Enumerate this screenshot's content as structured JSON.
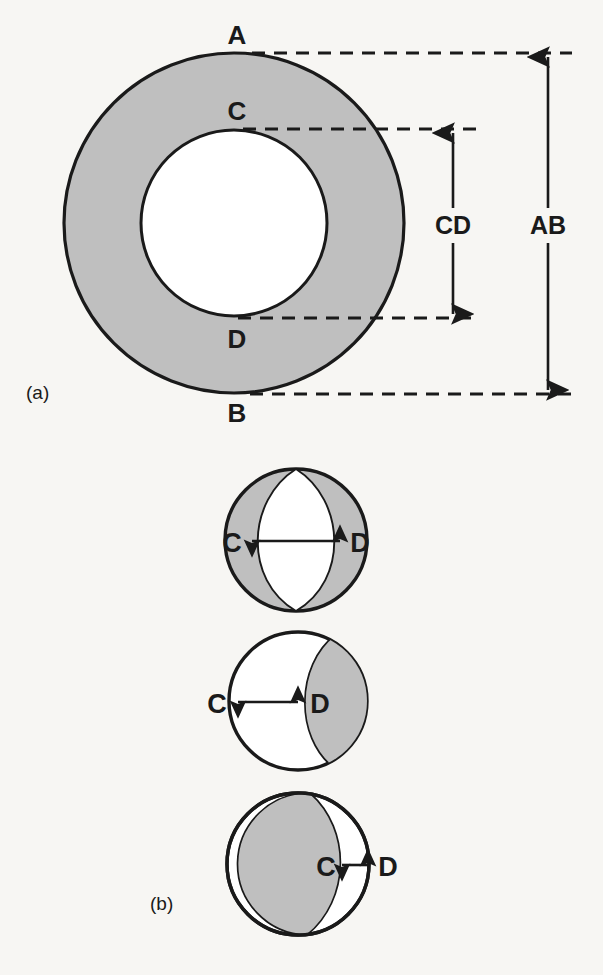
{
  "figure": {
    "background_color": "#f7f6f3",
    "shape_fill_color": "#bfbfbf",
    "shape_stroke_color": "#1a1a1a",
    "text_color": "#1a1a1a",
    "panels": [
      {
        "id": "a",
        "label": "(a)",
        "description": "annulus with outer circle AB and inner circle CD",
        "point_labels": {
          "outer_top": "A",
          "outer_bottom": "B",
          "inner_top": "C",
          "inner_bottom": "D"
        },
        "dimension_labels": {
          "outer_diameter": "AB",
          "inner_diameter": "CD"
        },
        "geometry": {
          "center_x": 234,
          "center_y": 223,
          "outer_radius": 170,
          "inner_radius": 93
        }
      },
      {
        "id": "b",
        "label": "(b)",
        "description": "three cross-sectional circles showing C-D separation",
        "circles": [
          {
            "name": "lens-wide",
            "left_label": "C",
            "right_label": "D",
            "arrow_span_label": "CD",
            "center_x": 296,
            "center_y": 540,
            "radius": 72,
            "fill": "gray-with-white-lens"
          },
          {
            "name": "crescent-right-gray",
            "left_label": "C",
            "right_label": "D",
            "arrow_span_label": "CD",
            "center_x": 298,
            "center_y": 701,
            "radius": 70,
            "fill": "white-with-gray-lune-right"
          },
          {
            "name": "crescent-right-white",
            "left_label": "C",
            "right_label": "D",
            "arrow_span_label": "CD",
            "center_x": 298,
            "center_y": 864,
            "radius": 72,
            "fill": "gray-with-white-lune-right"
          }
        ]
      }
    ]
  }
}
